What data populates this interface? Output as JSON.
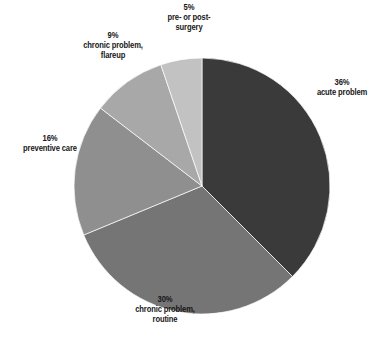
{
  "chart_data": {
    "type": "pie",
    "title": "",
    "subtitle": "",
    "xlabel": "",
    "ylabel": "",
    "legend_position": "none",
    "grid": false,
    "units": "percent",
    "start_angle_deg": 0,
    "direction": "clockwise",
    "categories": [
      "acute problem",
      "chronic problem, routine",
      "preventive care",
      "chronic problem, flareup",
      "pre- or post-surgery"
    ],
    "values": [
      36,
      30,
      16,
      9,
      5
    ],
    "slices": [
      {
        "label": "acute problem",
        "value": 36,
        "percent_text": "36%",
        "color": "#3a3a3a",
        "label_lines": [
          "acute problem"
        ],
        "label_position": "right"
      },
      {
        "label": "chronic problem, routine",
        "value": 30,
        "percent_text": "30%",
        "color": "#757575",
        "label_lines": [
          "chronic problem,",
          "routine"
        ],
        "label_position": "bottom"
      },
      {
        "label": "preventive care",
        "value": 16,
        "percent_text": "16%",
        "color": "#8f8f8f",
        "label_lines": [
          "preventive care"
        ],
        "label_position": "left"
      },
      {
        "label": "chronic problem, flareup",
        "value": 9,
        "percent_text": "9%",
        "color": "#a8a8a8",
        "label_lines": [
          "chronic problem,",
          "flareup"
        ],
        "label_position": "top-left"
      },
      {
        "label": "pre- or post-surgery",
        "value": 5,
        "percent_text": "5%",
        "color": "#c2c2c2",
        "label_lines": [
          "pre- or post-",
          "surgery"
        ],
        "label_position": "top"
      }
    ],
    "background_color": "#ffffff",
    "label_text_color": "#171717"
  },
  "labels": {
    "acute": {
      "pct": "36%",
      "line1": "acute problem",
      "line2": ""
    },
    "routine": {
      "pct": "30%",
      "line1": "chronic problem,",
      "line2": "routine"
    },
    "preventive": {
      "pct": "16%",
      "line1": "preventive care",
      "line2": ""
    },
    "flareup": {
      "pct": "9%",
      "line1": "chronic problem,",
      "line2": "flareup"
    },
    "surgery": {
      "pct": "5%",
      "line1": "pre- or post-",
      "line2": "surgery"
    }
  }
}
